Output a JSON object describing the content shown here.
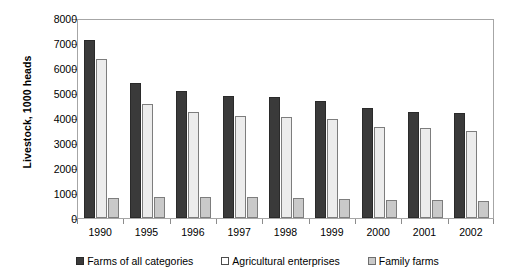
{
  "chart_data": {
    "type": "bar",
    "title": "",
    "subtitle": "",
    "xlabel": "",
    "ylabel": "Livestock, 1000 heads",
    "categories": [
      "1990",
      "1995",
      "1996",
      "1997",
      "1998",
      "1999",
      "2000",
      "2001",
      "2002"
    ],
    "series": [
      {
        "name": "Farms of all categories",
        "color": "#3a3a3a",
        "values": [
          7120,
          5400,
          5070,
          4880,
          4830,
          4680,
          4400,
          4250,
          4200
        ]
      },
      {
        "name": "Agricultural enterprises",
        "color": "#ececec",
        "values": [
          6360,
          4580,
          4250,
          4080,
          4050,
          3980,
          3650,
          3600,
          3480
        ]
      },
      {
        "name": "Family farms",
        "color": "#c9c9c9",
        "values": [
          800,
          830,
          840,
          830,
          800,
          770,
          720,
          740,
          680
        ]
      }
    ],
    "ylim": [
      0,
      8000
    ],
    "ytick_values": [
      0,
      1000,
      2000,
      3000,
      4000,
      5000,
      6000,
      7000,
      8000
    ],
    "ytick_labels": [
      "0",
      "1000",
      "2000",
      "3000",
      "4000",
      "5000",
      "6000",
      "7000",
      "8000"
    ],
    "grid": false,
    "legend_position": "bottom",
    "plot_border_color": "#a6a6a6"
  }
}
